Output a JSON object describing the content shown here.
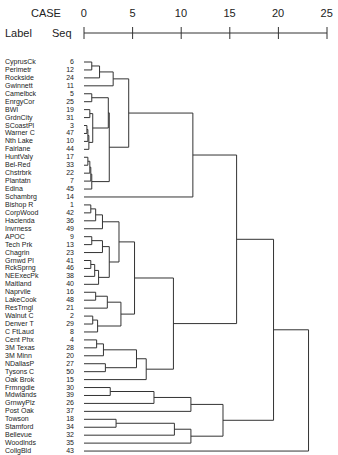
{
  "chart_data": {
    "type": "dendrogram",
    "title": "",
    "axis": {
      "label": "CASE",
      "ticks": [
        0,
        5,
        10,
        15,
        20,
        25
      ],
      "range": [
        0,
        25
      ]
    },
    "column_headers": {
      "label": "Label",
      "seq": "Seq"
    },
    "leaves": [
      {
        "label": "CyprusCk",
        "seq": "6"
      },
      {
        "label": "Perimetr",
        "seq": "12"
      },
      {
        "label": "Rockside",
        "seq": "24"
      },
      {
        "label": "Gwinnett",
        "seq": "11"
      },
      {
        "label": "Camelbck",
        "seq": "5"
      },
      {
        "label": "EnrgyCor",
        "seq": "25"
      },
      {
        "label": "BWI",
        "seq": "19"
      },
      {
        "label": "GrdnCity",
        "seq": "31"
      },
      {
        "label": "SCoastPl",
        "seq": "3"
      },
      {
        "label": "Warner C",
        "seq": "47"
      },
      {
        "label": "Nth Lake",
        "seq": "10"
      },
      {
        "label": "Fairlane",
        "seq": "44"
      },
      {
        "label": "HuntValy",
        "seq": "17"
      },
      {
        "label": "Bel-Red",
        "seq": "33"
      },
      {
        "label": "Chstrbrk",
        "seq": "22"
      },
      {
        "label": "Plantatn",
        "seq": "7"
      },
      {
        "label": "Edina",
        "seq": "45"
      },
      {
        "label": "Schambrg",
        "seq": "14"
      },
      {
        "label": "Bishop R",
        "seq": "1"
      },
      {
        "label": "CorpWood",
        "seq": "42"
      },
      {
        "label": "Hacienda",
        "seq": "36"
      },
      {
        "label": "Invrness",
        "seq": "49"
      },
      {
        "label": "APOC",
        "seq": "9"
      },
      {
        "label": "Tech Prk",
        "seq": "13"
      },
      {
        "label": "Chagrin",
        "seq": "23"
      },
      {
        "label": "Grnwd Pl",
        "seq": "41"
      },
      {
        "label": "RckSprng",
        "seq": "46"
      },
      {
        "label": "NEExecPk",
        "seq": "38"
      },
      {
        "label": "Maitland",
        "seq": "40"
      },
      {
        "label": "Naprvile",
        "seq": "16"
      },
      {
        "label": "LakeCook",
        "seq": "48"
      },
      {
        "label": "ResTrngl",
        "seq": "21"
      },
      {
        "label": "Walnut C",
        "seq": "2"
      },
      {
        "label": "Denver T",
        "seq": "29"
      },
      {
        "label": "C FtLaud",
        "seq": "8"
      },
      {
        "label": "Cent Phx",
        "seq": "4"
      },
      {
        "label": "3M Texas",
        "seq": "28"
      },
      {
        "label": "3M Minn",
        "seq": "20"
      },
      {
        "label": "NDallasP",
        "seq": "27"
      },
      {
        "label": "Tysons C",
        "seq": "50"
      },
      {
        "label": "Oak Brok",
        "seq": "15"
      },
      {
        "label": "Frmngdle",
        "seq": "30"
      },
      {
        "label": "Mdwlands",
        "seq": "39"
      },
      {
        "label": "GrnwyPlz",
        "seq": "26"
      },
      {
        "label": "Post Oak",
        "seq": "37"
      },
      {
        "label": "Towson",
        "seq": "18"
      },
      {
        "label": "Stamford",
        "seq": "34"
      },
      {
        "label": "Bellevue",
        "seq": "32"
      },
      {
        "label": "Woodlnds",
        "seq": "35"
      },
      {
        "label": "CollgBld",
        "seq": "43"
      }
    ],
    "merges_note": "each merge: [childA, childB, height]; leaves are indices 0-49, internal nodes referenced as 'nK' (K = merge index)",
    "merges": [
      [
        0,
        1,
        0.8
      ],
      [
        "n0",
        2,
        1.6
      ],
      [
        "n1",
        3,
        3.0
      ],
      [
        4,
        5,
        0.8
      ],
      [
        6,
        7,
        0.6
      ],
      [
        8,
        9,
        0.3
      ],
      [
        "n5",
        10,
        0.4
      ],
      [
        "n6",
        11,
        0.5
      ],
      [
        "n4",
        "n7",
        0.9
      ],
      [
        "n3",
        "n8",
        2.5
      ],
      [
        12,
        13,
        0.4
      ],
      [
        "n10",
        14,
        0.6
      ],
      [
        "n11",
        15,
        0.7
      ],
      [
        "n12",
        16,
        0.8
      ],
      [
        "n9",
        "n13",
        2.6
      ],
      [
        "n2",
        "n14",
        4.6
      ],
      [
        "n15",
        17,
        11.2
      ],
      [
        18,
        19,
        0.7
      ],
      [
        "n17",
        20,
        1.2
      ],
      [
        "n18",
        21,
        1.9
      ],
      [
        22,
        23,
        0.8
      ],
      [
        "n20",
        24,
        1.9
      ],
      [
        25,
        26,
        0.7
      ],
      [
        "n22",
        27,
        1.1
      ],
      [
        "n23",
        28,
        1.5
      ],
      [
        "n21",
        "n24",
        2.6
      ],
      [
        "n19",
        "n25",
        3.6
      ],
      [
        29,
        30,
        1.2
      ],
      [
        "n27",
        31,
        2.4
      ],
      [
        32,
        33,
        0.9
      ],
      [
        "n29",
        34,
        1.4
      ],
      [
        "n28",
        "n30",
        3.8
      ],
      [
        "n26",
        "n31",
        5.2
      ],
      [
        35,
        36,
        1.3
      ],
      [
        "n33",
        37,
        2.0
      ],
      [
        38,
        39,
        2.2
      ],
      [
        "n34",
        "n35",
        5.4
      ],
      [
        "n36",
        40,
        6.4
      ],
      [
        "n32",
        "n37",
        9.2
      ],
      [
        "n16",
        "n38",
        15.7
      ],
      [
        41,
        42,
        2.7
      ],
      [
        "n40",
        43,
        7.2
      ],
      [
        "n41",
        44,
        11.0
      ],
      [
        45,
        46,
        3.3
      ],
      [
        "n43",
        47,
        9.3
      ],
      [
        "n44",
        48,
        11.0
      ],
      [
        "n42",
        "n45",
        14.3
      ],
      [
        "n39",
        "n46",
        19.5
      ],
      [
        "n47",
        49,
        23.1
      ]
    ]
  }
}
